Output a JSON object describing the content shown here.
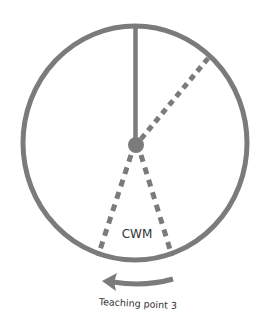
{
  "diagram": {
    "colors": {
      "stroke": "#7b7b7b",
      "text": "#333333",
      "background": "#ffffff"
    },
    "circle": {
      "cx": 135,
      "cy": 143,
      "rx": 112,
      "ry": 117,
      "stroke_width": 5
    },
    "center_point": {
      "cx": 136,
      "cy": 145,
      "r": 8
    },
    "lines": [
      {
        "name": "vertical-reference-line",
        "style": "solid",
        "x1": 135.5,
        "y1": 27,
        "x2": 135.5,
        "y2": 145
      },
      {
        "name": "upper-right-dashed-line",
        "style": "dashed",
        "x1": 141,
        "y1": 139,
        "x2": 210,
        "y2": 56
      },
      {
        "name": "lower-left-dashed-line",
        "style": "dashed",
        "x1": 131,
        "y1": 155,
        "x2": 98,
        "y2": 256
      },
      {
        "name": "lower-right-dashed-line",
        "style": "dashed",
        "x1": 141,
        "y1": 155,
        "x2": 172,
        "y2": 256
      }
    ],
    "sector_label": "CWM",
    "arrow": {
      "direction": "left",
      "icon": "curved-arrow-left-icon"
    },
    "caption": "Teaching point 3"
  }
}
